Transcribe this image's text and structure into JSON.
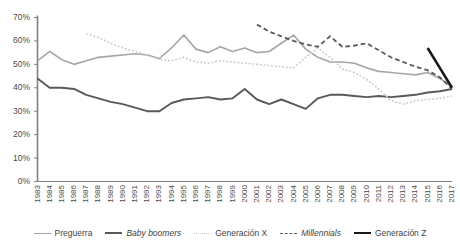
{
  "chart_data": {
    "type": "line",
    "title": "",
    "xlabel": "",
    "ylabel": "",
    "ylim": [
      0,
      0.7
    ],
    "ytick_labels": [
      "0%",
      "10%",
      "20%",
      "30%",
      "40%",
      "50%",
      "60%",
      "70%"
    ],
    "ytick_values": [
      0,
      10,
      20,
      30,
      40,
      50,
      60,
      70
    ],
    "grid": false,
    "legend_position": "bottom",
    "categories": [
      "1983",
      "1984",
      "1985",
      "1986",
      "1987",
      "1988",
      "1989",
      "1990",
      "1991",
      "1992",
      "1993",
      "1994",
      "1995",
      "1996",
      "1997",
      "1998",
      "1999",
      "2000",
      "2001",
      "2002",
      "2003",
      "2004",
      "2005",
      "2006",
      "2007",
      "2008",
      "2009",
      "2010",
      "2011",
      "2012",
      "2013",
      "2014",
      "2015",
      "2016",
      "2017"
    ],
    "series": [
      {
        "name": "Preguerra",
        "color": "#a6a6a6",
        "style": "solid",
        "width": 1.6,
        "values": [
          51.5,
          55.5,
          52.0,
          50.0,
          51.5,
          53.0,
          53.5,
          54.0,
          54.5,
          54.0,
          52.5,
          57.0,
          62.5,
          56.5,
          55.0,
          57.5,
          55.5,
          57.0,
          55.0,
          55.5,
          59.0,
          62.5,
          56.5,
          53.0,
          51.0,
          51.0,
          50.5,
          48.5,
          47.0,
          46.5,
          46.0,
          45.5,
          46.5,
          44.0,
          40.5
        ]
      },
      {
        "name": "Baby boomers",
        "color": "#595959",
        "style": "solid",
        "width": 1.9,
        "values": [
          44.0,
          40.0,
          40.0,
          39.5,
          37.0,
          35.5,
          34.0,
          33.0,
          31.5,
          30.0,
          30.0,
          33.5,
          35.0,
          35.5,
          36.0,
          35.0,
          35.5,
          39.5,
          35.0,
          33.0,
          35.0,
          33.0,
          31.0,
          35.5,
          37.0,
          37.0,
          36.5,
          36.0,
          36.5,
          36.0,
          36.5,
          37.0,
          38.0,
          38.5,
          39.5
        ]
      },
      {
        "name": "Generación X",
        "color": "#c9c9c9",
        "style": "dotted",
        "width": 1.5,
        "start_index": 4,
        "values": [
          null,
          null,
          null,
          null,
          63.0,
          61.5,
          59.0,
          57.0,
          55.5,
          54.0,
          52.0,
          51.5,
          53.0,
          51.0,
          50.5,
          51.5,
          51.0,
          50.5,
          50.0,
          49.5,
          49.0,
          48.5,
          53.0,
          57.0,
          53.0,
          48.0,
          46.5,
          43.5,
          39.5,
          34.5,
          33.0,
          34.5,
          35.0,
          35.5,
          36.5
        ]
      },
      {
        "name": "Millennials",
        "color": "#595959",
        "style": "dashed",
        "width": 1.8,
        "start_index": 18,
        "values": [
          null,
          null,
          null,
          null,
          null,
          null,
          null,
          null,
          null,
          null,
          null,
          null,
          null,
          null,
          null,
          null,
          null,
          null,
          67.0,
          64.0,
          62.0,
          60.0,
          58.5,
          57.5,
          62.0,
          57.5,
          58.0,
          59.0,
          56.0,
          53.0,
          51.0,
          49.0,
          47.5,
          44.5,
          39.5
        ]
      },
      {
        "name": "Generación Z",
        "color": "#1a1a1a",
        "style": "solid",
        "width": 2.6,
        "start_index": 32,
        "values": [
          null,
          null,
          null,
          null,
          null,
          null,
          null,
          null,
          null,
          null,
          null,
          null,
          null,
          null,
          null,
          null,
          null,
          null,
          null,
          null,
          null,
          null,
          null,
          null,
          null,
          null,
          null,
          null,
          null,
          null,
          null,
          null,
          57.0,
          48.5,
          40.0
        ]
      }
    ]
  },
  "legend": {
    "items": [
      {
        "label": "Preguerra",
        "color": "#a6a6a6",
        "style": "solid",
        "width": 1.8,
        "italic": false
      },
      {
        "label": "Baby boomers",
        "color": "#595959",
        "style": "solid",
        "width": 2.6,
        "italic": true
      },
      {
        "label": "Generación X",
        "color": "#c9c9c9",
        "style": "dotted",
        "width": 1.8,
        "italic": false
      },
      {
        "label": "Millennials",
        "color": "#595959",
        "style": "dashed",
        "width": 1.8,
        "italic": true
      },
      {
        "label": "Generación Z",
        "color": "#1a1a1a",
        "style": "solid",
        "width": 2.8,
        "italic": false
      }
    ]
  },
  "axes": {
    "axis_color": "#808080",
    "tick_color": "#4a4a4a"
  }
}
